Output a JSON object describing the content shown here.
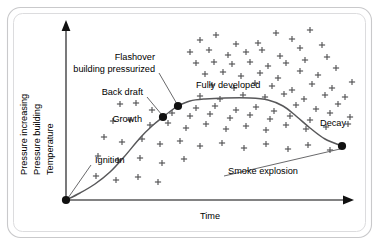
{
  "figure": {
    "frame": {
      "border_color": "#c9c9cb",
      "inner_border_color": "#dcdcde",
      "background": "#ffffff"
    }
  },
  "axes": {
    "x": {
      "label": "Time",
      "arrow": true,
      "origin": [
        66,
        200
      ],
      "end": [
        354,
        200
      ],
      "label_pos": [
        210,
        216
      ]
    },
    "y": {
      "labels": [
        "Pressure increasing",
        "Pressure building",
        "Temperature"
      ],
      "arrow": true,
      "origin": [
        66,
        200
      ],
      "end": [
        66,
        22
      ],
      "label_x_positions": [
        27,
        40,
        53
      ]
    }
  },
  "annotations": [
    {
      "id": "ignition",
      "text": "Ignition",
      "x": 95,
      "y": 161,
      "anchor": "start",
      "leader": true,
      "leader_to": [
        68,
        198
      ]
    },
    {
      "id": "growth",
      "text": "Growth",
      "x": 142,
      "y": 120,
      "anchor": "end",
      "leader": false
    },
    {
      "id": "back-draft",
      "text": "Back draft",
      "x": 143,
      "y": 93,
      "anchor": "end",
      "leader": true,
      "leader_to": [
        162,
        115
      ]
    },
    {
      "id": "flashover",
      "text": "Flashover",
      "x": 155,
      "y": 58,
      "anchor": "end",
      "leader": false
    },
    {
      "id": "building-pressurized",
      "text": "building pressurized",
      "x": 155,
      "y": 69,
      "anchor": "end",
      "leader": true,
      "leader_to": [
        177,
        104
      ]
    },
    {
      "id": "fully-developed",
      "text": "Fully developed",
      "x": 196,
      "y": 86,
      "anchor": "start",
      "leader": false
    },
    {
      "id": "decay",
      "text": "Decay",
      "x": 320,
      "y": 124,
      "anchor": "start",
      "leader": false
    },
    {
      "id": "smoke-explosion",
      "text": "Smoke explosion",
      "x": 228,
      "y": 172,
      "anchor": "start",
      "leader": true,
      "leader_to": [
        340,
        149
      ]
    }
  ],
  "chart_data": {
    "type": "line",
    "xlabel": "Time",
    "ylabel": "Pressure increasing / Pressure building / Temperature",
    "grid": false,
    "legend": null,
    "xlim": [
      0,
      1
    ],
    "ylim": [
      0,
      1
    ],
    "series": [
      {
        "name": "Fire growth curve",
        "description": "S-shaped curve: ignition at origin, rising growth phase, back draft and flashover nodes, a fully developed plateau, then decay falling to the smoke explosion node.",
        "points_px": [
          [
            66,
            200
          ],
          [
            80,
            193
          ],
          [
            95,
            184
          ],
          [
            110,
            172
          ],
          [
            124,
            157
          ],
          [
            140,
            138
          ],
          [
            152,
            126
          ],
          [
            163,
            117
          ],
          [
            172,
            110
          ],
          [
            178,
            106
          ],
          [
            190,
            101
          ],
          [
            205,
            99
          ],
          [
            225,
            98
          ],
          [
            250,
            98
          ],
          [
            268,
            100
          ],
          [
            283,
            106
          ],
          [
            296,
            116
          ],
          [
            310,
            128
          ],
          [
            325,
            139
          ],
          [
            342,
            146
          ]
        ]
      }
    ],
    "nodes": [
      {
        "name": "Ignition",
        "px": [
          66,
          200
        ],
        "stage": "ignition"
      },
      {
        "name": "Back draft",
        "px": [
          163,
          117
        ],
        "stage": "back-draft"
      },
      {
        "name": "Flashover / building pressurized",
        "px": [
          178,
          106
        ],
        "stage": "flashover"
      },
      {
        "name": "Smoke explosion",
        "px": [
          342,
          146
        ],
        "stage": "smoke-explosion"
      }
    ],
    "stages": [
      "Ignition",
      "Growth",
      "Back draft",
      "Flashover / building pressurized",
      "Fully developed",
      "Decay",
      "Smoke explosion"
    ],
    "scatter_markers": {
      "symbol": "+",
      "name": "smoke / heat particles",
      "color": "#4d4d4f",
      "points_px": [
        [
          200,
          40
        ],
        [
          216,
          35
        ],
        [
          236,
          44
        ],
        [
          258,
          43
        ],
        [
          276,
          33
        ],
        [
          292,
          39
        ],
        [
          310,
          30
        ],
        [
          190,
          52
        ],
        [
          209,
          50
        ],
        [
          228,
          55
        ],
        [
          246,
          52
        ],
        [
          262,
          50
        ],
        [
          280,
          56
        ],
        [
          300,
          48
        ],
        [
          322,
          45
        ],
        [
          196,
          63
        ],
        [
          214,
          62
        ],
        [
          232,
          64
        ],
        [
          250,
          62
        ],
        [
          268,
          66
        ],
        [
          286,
          63
        ],
        [
          305,
          60
        ],
        [
          327,
          57
        ],
        [
          205,
          74
        ],
        [
          223,
          72
        ],
        [
          241,
          76
        ],
        [
          260,
          73
        ],
        [
          278,
          78
        ],
        [
          300,
          71
        ],
        [
          318,
          75
        ],
        [
          336,
          68
        ],
        [
          212,
          85
        ],
        [
          234,
          88
        ],
        [
          255,
          83
        ],
        [
          272,
          86
        ],
        [
          292,
          90
        ],
        [
          312,
          84
        ],
        [
          332,
          88
        ],
        [
          352,
          82
        ],
        [
          200,
          96
        ],
        [
          220,
          99
        ],
        [
          243,
          95
        ],
        [
          265,
          97
        ],
        [
          284,
          94
        ],
        [
          304,
          99
        ],
        [
          325,
          95
        ],
        [
          345,
          97
        ],
        [
          196,
          108
        ],
        [
          215,
          106
        ],
        [
          236,
          110
        ],
        [
          256,
          107
        ],
        [
          274,
          111
        ],
        [
          296,
          105
        ],
        [
          316,
          109
        ],
        [
          338,
          104
        ],
        [
          120,
          104
        ],
        [
          136,
          103
        ],
        [
          152,
          110
        ],
        [
          172,
          113
        ],
        [
          190,
          116
        ],
        [
          210,
          114
        ],
        [
          230,
          118
        ],
        [
          250,
          115
        ],
        [
          270,
          119
        ],
        [
          290,
          116
        ],
        [
          310,
          120
        ],
        [
          330,
          113
        ],
        [
          350,
          117
        ],
        [
          113,
          121
        ],
        [
          130,
          120
        ],
        [
          150,
          125
        ],
        [
          168,
          123
        ],
        [
          186,
          128
        ],
        [
          206,
          124
        ],
        [
          226,
          129
        ],
        [
          246,
          126
        ],
        [
          266,
          130
        ],
        [
          286,
          125
        ],
        [
          306,
          129
        ],
        [
          326,
          127
        ],
        [
          348,
          124
        ],
        [
          104,
          137
        ],
        [
          122,
          142
        ],
        [
          142,
          139
        ],
        [
          160,
          144
        ],
        [
          180,
          141
        ],
        [
          200,
          146
        ],
        [
          222,
          143
        ],
        [
          244,
          148
        ],
        [
          266,
          144
        ],
        [
          288,
          149
        ],
        [
          308,
          145
        ],
        [
          330,
          150
        ],
        [
          98,
          156
        ],
        [
          118,
          160
        ],
        [
          140,
          158
        ],
        [
          162,
          163
        ],
        [
          184,
          159
        ],
        [
          96,
          176
        ],
        [
          116,
          180
        ],
        [
          138,
          177
        ],
        [
          158,
          182
        ]
      ]
    }
  }
}
